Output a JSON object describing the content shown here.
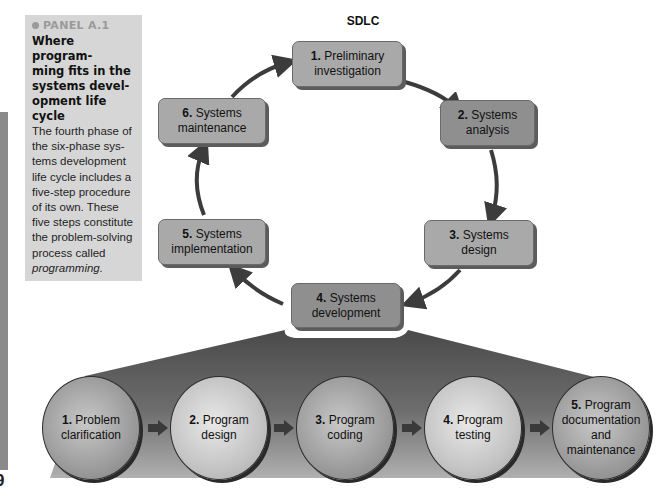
{
  "page_fragment": "9",
  "panel": {
    "tag": "PANEL A.1",
    "title": "Where programming fits in the systems development life cycle",
    "title_lines": [
      "Where program-",
      "ming fits in the",
      "systems devel-",
      "opment life",
      "cycle"
    ],
    "body_lines": [
      "The fourth phase of",
      "the six-phase sys-",
      "tems development",
      "life cycle includes a",
      "five-step procedure",
      "of its own. These",
      "five steps constitute",
      "the problem-solving",
      "process called"
    ],
    "body_italic": "programming."
  },
  "sdlc": {
    "title": "SDLC",
    "phases": [
      {
        "num": "1.",
        "line1": "Preliminary",
        "line2": "investigation"
      },
      {
        "num": "2.",
        "line1": "Systems",
        "line2": "analysis"
      },
      {
        "num": "3.",
        "line1": "Systems",
        "line2": "design"
      },
      {
        "num": "4.",
        "line1": "Systems",
        "line2": "development"
      },
      {
        "num": "5.",
        "line1": "Systems",
        "line2": "implementation"
      },
      {
        "num": "6.",
        "line1": "Systems",
        "line2": "maintenance"
      }
    ]
  },
  "programming_steps": [
    {
      "num": "1.",
      "line1": "Problem",
      "line2": "clarification"
    },
    {
      "num": "2.",
      "line1": "Program",
      "line2": "design"
    },
    {
      "num": "3.",
      "line1": "Program",
      "line2": "coding"
    },
    {
      "num": "4.",
      "line1": "Program",
      "line2": "testing"
    },
    {
      "num": "5.",
      "line1": "Program",
      "line2": "documentation",
      "line3": "and",
      "line4": "maintenance"
    }
  ],
  "colors": {
    "panel_bg": "#d6d6d6",
    "box_fill": "#a9a9a9",
    "box_dark_fill": "#8f8f8f",
    "arrow": "#3c3c3c",
    "funnel_top": "#4a4a4a",
    "funnel_bottom": "#a8a8a8"
  }
}
